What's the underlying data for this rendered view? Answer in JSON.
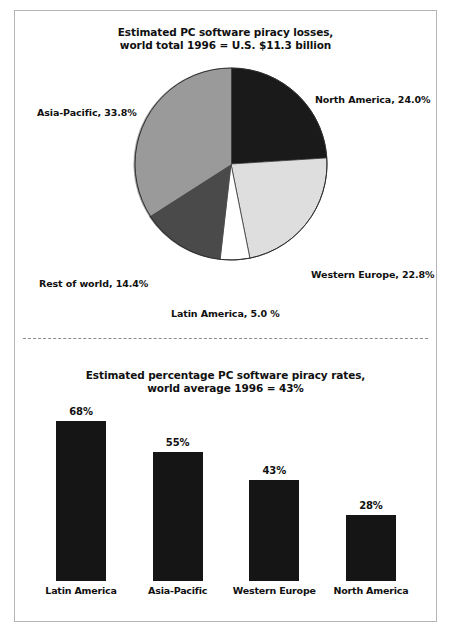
{
  "figure": {
    "border_color": "#b5b5b5",
    "background": "#ffffff"
  },
  "pie": {
    "title_line1": "Estimated PC software piracy losses,",
    "title_line2": "world total 1996 = U.S. $11.3 billion",
    "labels": {
      "north_america": "North America, 24.0%",
      "western_europe": "Western Europe, 22.8%",
      "latin_america": "Latin America, 5.0 %",
      "rest_of_world": "Rest of world, 14.4%",
      "asia_pacific": "Asia-Pacific, 33.8%"
    }
  },
  "bars": {
    "title_line1": "Estimated percentage PC software piracy rates,",
    "title_line2": "world average 1996 = 43%",
    "values": [
      "68%",
      "55%",
      "43%",
      "28%"
    ],
    "categories": [
      "Latin America",
      "Asia-Pacific",
      "Western Europe",
      "North America"
    ]
  },
  "chart_data": [
    {
      "type": "pie",
      "title": "Estimated PC software piracy losses, world total 1996 = U.S. $11.3 billion",
      "total_label": "U.S. $11.3 billion",
      "year": 1996,
      "unit": "percent of total losses",
      "categories": [
        "North America",
        "Western Europe",
        "Latin America",
        "Rest of world",
        "Asia-Pacific"
      ],
      "values": [
        24.0,
        22.8,
        5.0,
        14.4,
        33.8
      ],
      "colors": [
        "#1a1a1a",
        "#dedede",
        "#ffffff",
        "#4a4a4a",
        "#9a9a9a"
      ],
      "slice_order": "clockwise from 12 o'clock",
      "legend": "inline data labels around pie",
      "grid": false
    },
    {
      "type": "bar",
      "title": "Estimated percentage PC software piracy rates, world average 1996 = 43%",
      "world_average": 43,
      "categories": [
        "Latin America",
        "Asia-Pacific",
        "Western Europe",
        "North America"
      ],
      "values": [
        68,
        55,
        43,
        28
      ],
      "xlabel": "",
      "ylabel": "",
      "ylim": [
        0,
        68
      ],
      "bar_color": "#151515",
      "data_labels": [
        "68%",
        "55%",
        "43%",
        "28%"
      ],
      "grid": false,
      "axis_visible": false
    }
  ]
}
